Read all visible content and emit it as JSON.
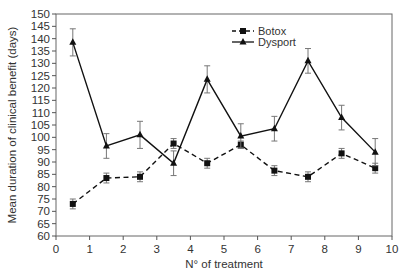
{
  "chart_data": {
    "type": "line",
    "title": "",
    "xlabel": "N° of treatment",
    "ylabel": "Mean duration of clinical benefit (days)",
    "xlim": [
      0,
      10
    ],
    "ylim": [
      60,
      150
    ],
    "xticks": [
      0,
      1,
      2,
      3,
      4,
      5,
      6,
      7,
      8,
      9,
      10
    ],
    "yticks": [
      60,
      65,
      70,
      75,
      80,
      85,
      90,
      95,
      100,
      105,
      110,
      115,
      120,
      125,
      130,
      135,
      140,
      145,
      150
    ],
    "grid": false,
    "legend_position": "top-center",
    "x": [
      0.5,
      1.5,
      2.5,
      3.5,
      4.5,
      5.5,
      6.5,
      7.5,
      8.5,
      9.5
    ],
    "series": [
      {
        "name": "Botox",
        "style": "dashed",
        "marker": "square",
        "color": "#111111",
        "values": [
          73,
          83.5,
          84,
          97.5,
          89.5,
          97,
          86.5,
          84,
          93.5,
          87.5
        ],
        "errors": [
          2,
          2,
          2,
          2,
          2,
          1.5,
          2,
          2,
          2,
          2
        ]
      },
      {
        "name": "Dysport",
        "style": "solid",
        "marker": "triangle",
        "color": "#111111",
        "values": [
          138.5,
          96.5,
          101,
          89.5,
          123.5,
          100.5,
          103.5,
          131,
          108,
          94
        ],
        "errors": [
          5.5,
          5,
          5.5,
          5,
          5.5,
          5,
          5,
          5,
          5,
          5.5
        ]
      }
    ]
  }
}
